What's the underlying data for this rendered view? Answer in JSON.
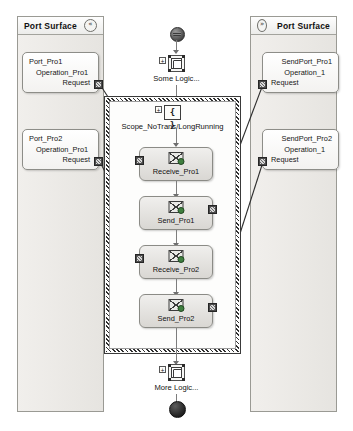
{
  "panels": {
    "left": {
      "title": "Port Surface",
      "collapse_icon": "chevron-double-left-icon",
      "collapse_glyph": "«",
      "ports": [
        {
          "name": "Port_Pro1",
          "operation": "Operation_Pro1",
          "message": "Request",
          "handle": "port-connector-handle"
        },
        {
          "name": "Port_Pro2",
          "operation": "Operation_Pro1",
          "message": "Request",
          "handle": "port-connector-handle"
        }
      ]
    },
    "right": {
      "title": "Port Surface",
      "collapse_icon": "chevron-double-right-icon",
      "collapse_glyph": "»",
      "ports": [
        {
          "name": "SendPort_Pro1",
          "operation": "Operation_1",
          "message": "Request",
          "handle": "port-connector-handle"
        },
        {
          "name": "SendPort_Pro2",
          "operation": "Operation_1",
          "message": "Request",
          "handle": "port-connector-handle"
        }
      ]
    }
  },
  "flow": {
    "start_node": "start-node",
    "end_node": "end-node",
    "top_logic": {
      "label": "Some Logic...",
      "icon": "expression-shape-icon",
      "expander": "+"
    },
    "bottom_logic": {
      "label": "More Logic...",
      "icon": "expression-shape-icon",
      "expander": "+"
    },
    "scope": {
      "title": "Scope_NoTrans/LongRunning",
      "icon": "scope-braces-icon",
      "icon_glyph": "{ }",
      "expander": "+"
    },
    "activities": [
      {
        "label": "Receive_Pro1",
        "icon": "receive-message-icon",
        "handle_side": "left"
      },
      {
        "label": "Send_Pro1",
        "icon": "send-message-icon",
        "handle_side": "right"
      },
      {
        "label": "Receive_Pro2",
        "icon": "receive-message-icon",
        "handle_side": "left"
      },
      {
        "label": "Send_Pro2",
        "icon": "send-message-icon",
        "handle_side": "right"
      }
    ]
  },
  "colors": {
    "panel_bg": "#eceae6",
    "panel_border": "#9a9a94",
    "activity_fill": "#e6e4e0",
    "wire": "#3a3a3a",
    "flow_line": "#7d7d7d"
  }
}
